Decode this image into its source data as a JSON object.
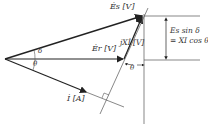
{
  "diagram": {
    "type": "phasor-diagram",
    "labels": {
      "Es": "Ės [V]",
      "Er": "Ėr [V]",
      "I": "İ [A]",
      "jXI": "jXİ [V]",
      "delta": "δ",
      "theta_left": "θ",
      "theta_right": "θ",
      "eq_line1": "Es sin δ",
      "eq_line2": "= XI cos θ"
    },
    "colors": {
      "line": "#333333"
    }
  }
}
